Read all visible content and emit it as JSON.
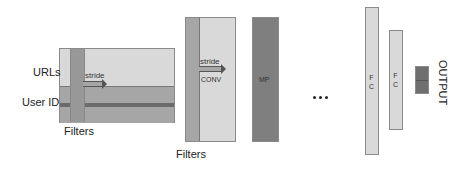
{
  "diagram": {
    "input": {
      "row_labels": [
        "URLs",
        "User ID"
      ],
      "filter_label": "Filters",
      "stride_label": "stride"
    },
    "conv": {
      "label": "CONV",
      "stride_label": "stride",
      "filter_label": "Filters"
    },
    "pool": {
      "label": "MP"
    },
    "ellipsis": "...",
    "fc_layers": [
      {
        "label_lines": [
          "F",
          "C"
        ]
      },
      {
        "label_lines": [
          "F",
          "C"
        ]
      }
    ],
    "output": {
      "label": "OUTPUT"
    },
    "colors": {
      "light": "#d9d9d9",
      "mid": "#a6a6a6",
      "dark": "#7f7f7f",
      "stripe": "#6b6b6b"
    }
  }
}
